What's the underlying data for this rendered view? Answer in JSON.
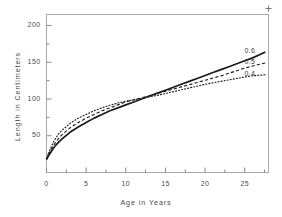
{
  "chart_data": {
    "type": "line",
    "title": "",
    "xlabel": "Age in Years",
    "ylabel": "Length in Centimeters",
    "xlim": [
      0,
      28
    ],
    "ylim": [
      0,
      215
    ],
    "xticks": [
      0,
      5,
      10,
      15,
      20,
      25
    ],
    "yticks": [
      50,
      100,
      150,
      200
    ],
    "xtick_labels": [
      "0",
      "5",
      "10",
      "15",
      "20",
      "25"
    ],
    "ytick_labels": [
      "50",
      "100",
      "150",
      "200"
    ],
    "grid": false,
    "legend_position": "right-inline",
    "series": [
      {
        "name": "0.6",
        "label": "0.6",
        "style": "solid",
        "color": "#1a1a1a",
        "x": [
          0,
          0.5,
          1,
          1.5,
          2,
          3,
          4,
          5,
          6,
          7,
          8,
          9,
          10,
          11,
          12,
          13,
          14,
          15,
          16,
          17,
          18,
          19,
          20,
          21,
          22,
          23,
          24,
          25,
          26,
          27,
          27.6
        ],
        "y": [
          18,
          27,
          35,
          41,
          46,
          55,
          62,
          68,
          74,
          79,
          84,
          88,
          92,
          96,
          100,
          104,
          108,
          112,
          116,
          120,
          124,
          128,
          132,
          136,
          140,
          144,
          148,
          152,
          156,
          161,
          164
        ]
      },
      {
        "name": "0.5",
        "label": "0.5",
        "style": "dashed",
        "color": "#1a1a1a",
        "x": [
          0,
          0.5,
          1,
          1.5,
          2,
          3,
          4,
          5,
          6,
          7,
          8,
          9,
          10,
          11,
          12,
          13,
          14,
          15,
          16,
          17,
          18,
          19,
          20,
          21,
          22,
          23,
          24,
          25,
          26,
          27,
          27.6
        ],
        "y": [
          18,
          30,
          39,
          46,
          52,
          61,
          68,
          74,
          79,
          84,
          88,
          92,
          96,
          99,
          101.5,
          104.5,
          107.5,
          110.5,
          113.5,
          116.5,
          119.5,
          122.5,
          125.5,
          128.5,
          131.5,
          135,
          138.5,
          142,
          145,
          147.5,
          149
        ]
      },
      {
        "name": "0.4",
        "label": "0.4",
        "style": "dotted",
        "color": "#1a1a1a",
        "x": [
          0,
          0.5,
          1,
          1.5,
          2,
          3,
          4,
          5,
          6,
          7,
          8,
          9,
          10,
          11,
          12,
          13,
          14,
          15,
          16,
          17,
          18,
          19,
          20,
          21,
          22,
          23,
          24,
          25,
          26,
          27,
          27.6
        ],
        "y": [
          18,
          33,
          44,
          52,
          58,
          67,
          74,
          79,
          84,
          88,
          91.5,
          94.5,
          97,
          99,
          101,
          103,
          105,
          107.5,
          110,
          112.5,
          115,
          117.5,
          120,
          122,
          124,
          126,
          128,
          130,
          131.5,
          132.5,
          133
        ]
      }
    ]
  },
  "legend": {
    "entries": [
      {
        "label": "0.6"
      },
      {
        "label": "0.5"
      },
      {
        "label": "0.4"
      }
    ]
  }
}
